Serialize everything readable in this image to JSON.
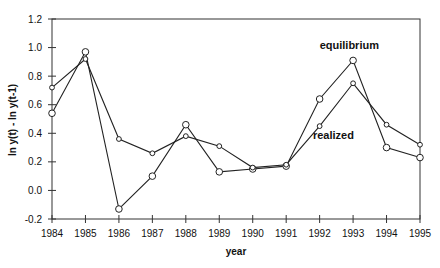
{
  "chart_data": {
    "type": "line",
    "title": "",
    "xlabel": "year",
    "ylabel": "ln y(t) - ln y(t-1)",
    "x": [
      1984,
      1985,
      1986,
      1987,
      1988,
      1989,
      1990,
      1991,
      1992,
      1993,
      1994,
      1995
    ],
    "xticks": [
      "1984",
      "1985",
      "1986",
      "1987",
      "1988",
      "1989",
      "1990",
      "1991",
      "1992",
      "1993",
      "1994",
      "1995"
    ],
    "yticks": [
      "-0.2",
      "0.0",
      "0.2",
      "0.4",
      "0.6",
      "0.8",
      "1.0",
      "1.2"
    ],
    "ylim": [
      -0.2,
      1.2
    ],
    "grid": false,
    "legend": "inline annotations",
    "series": [
      {
        "name": "equilibrium",
        "marker": "large-circle",
        "values": [
          0.54,
          0.97,
          -0.13,
          0.1,
          0.46,
          0.13,
          0.15,
          0.17,
          0.64,
          0.91,
          0.3,
          0.23
        ]
      },
      {
        "name": "realized",
        "marker": "small-circle",
        "values": [
          0.72,
          0.92,
          0.36,
          0.26,
          0.38,
          0.31,
          0.16,
          0.18,
          0.45,
          0.75,
          0.46,
          0.32
        ]
      }
    ],
    "annotations": [
      {
        "text": "equilibrium",
        "x": 1992.3,
        "y": 0.99
      },
      {
        "text": "realized",
        "x": 1992.1,
        "y": 0.36
      }
    ]
  }
}
